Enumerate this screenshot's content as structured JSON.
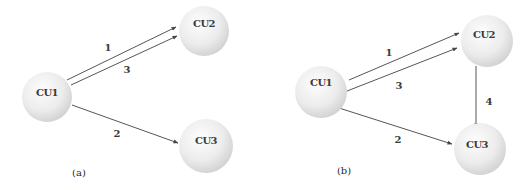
{
  "diagram": {
    "panels": [
      {
        "caption": "(a)",
        "nodes": [
          {
            "id": "CU1",
            "label": "CU1"
          },
          {
            "id": "CU2",
            "label": "CU2"
          },
          {
            "id": "CU3",
            "label": "CU3"
          }
        ],
        "edges": [
          {
            "from": "CU1",
            "to": "CU2",
            "label": "1"
          },
          {
            "from": "CU1",
            "to": "CU2",
            "label": "3"
          },
          {
            "from": "CU1",
            "to": "CU3",
            "label": "2"
          }
        ]
      },
      {
        "caption": "(b)",
        "nodes": [
          {
            "id": "CU1",
            "label": "CU1"
          },
          {
            "id": "CU2",
            "label": "CU2"
          },
          {
            "id": "CU3",
            "label": "CU3"
          }
        ],
        "edges": [
          {
            "from": "CU1",
            "to": "CU2",
            "label": "1"
          },
          {
            "from": "CU1",
            "to": "CU2",
            "label": "3"
          },
          {
            "from": "CU1",
            "to": "CU3",
            "label": "2"
          },
          {
            "from": "CU2",
            "to": "CU3",
            "label": "4"
          }
        ]
      }
    ],
    "colors": {
      "node_fill_light": "#fafafa",
      "node_fill_dark": "#d4d4d4",
      "edge": "#555555",
      "text": "#3a3a3a"
    }
  }
}
